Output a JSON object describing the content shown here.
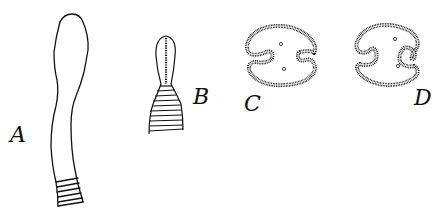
{
  "figure": {
    "panels": [
      {
        "id": "A",
        "label": "A",
        "description": "elongated tubular structure with club-shaped upper end and annulated base"
      },
      {
        "id": "B",
        "label": "B",
        "description": "club-shaped structure with central dotted line and annulated flared base"
      },
      {
        "id": "C",
        "label": "C",
        "description": "transverse section, ring with two inward folds and two small dots"
      },
      {
        "id": "D",
        "label": "D",
        "description": "transverse section, ring with two inward spiral folds and two small dots"
      }
    ],
    "colors": {
      "ink": "#111111",
      "background": "#ffffff"
    }
  }
}
